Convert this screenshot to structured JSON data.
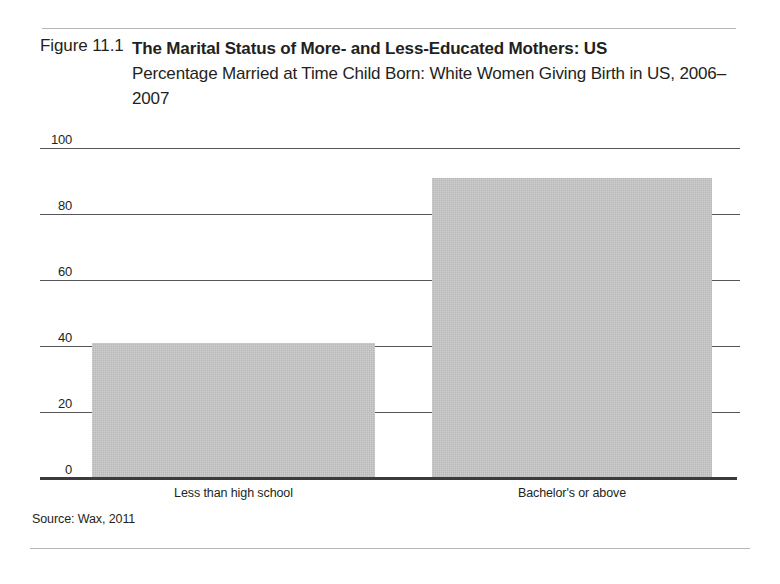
{
  "figure": {
    "number_label": "Figure 11.1",
    "source_note": "Source: Wax, 2011"
  },
  "chart_data": {
    "type": "bar",
    "title": "The Marital Status of More- and Less-Educated Mothers: US",
    "subtitle": "Percentage Married at Time Child Born: White Women Giving Birth in US, 2006–2007",
    "categories": [
      "Less than high school",
      "Bachelor's or above"
    ],
    "values": [
      41,
      91
    ],
    "xlabel": "",
    "ylabel": "",
    "ylim": [
      0,
      100
    ],
    "yticks": [
      0,
      20,
      40,
      60,
      80,
      100
    ],
    "ytick_labels": [
      "0",
      "20",
      "40",
      "60",
      "80",
      "100"
    ],
    "grid": true,
    "legend": false,
    "bar_color": "#b9b9b9",
    "axis_color": "#3b3b3f",
    "gridline_color": "#56565a"
  }
}
